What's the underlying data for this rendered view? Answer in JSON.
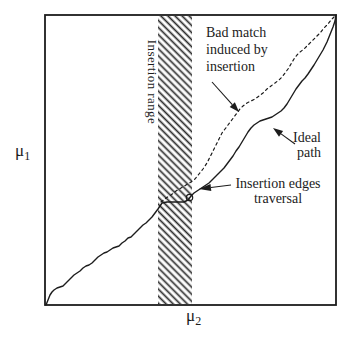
{
  "figure": {
    "background": "#ffffff",
    "ink": "#1c1c1c",
    "labels": {
      "mu1": {
        "base": "μ",
        "sub": "1"
      },
      "mu2": {
        "base": "μ",
        "sub": "2"
      },
      "insertion_range": "Insertion range",
      "bad_match_line1": "Bad match",
      "bad_match_line2": "induced by",
      "bad_match_line3": "insertion",
      "ideal_line1": "Ideal",
      "ideal_line2": "path",
      "insertion_edges_line1": "Insertion edges",
      "insertion_edges_line2": "traversal"
    }
  },
  "chart_data": {
    "type": "line",
    "title": "",
    "xlabel": "μ2",
    "ylabel": "μ1",
    "grid": false,
    "frame": {
      "x": 45,
      "y": 15,
      "w": 291,
      "h": 290
    },
    "insertion_band": {
      "x": 158,
      "w": 34
    },
    "loop": {
      "cx": 189.5,
      "cy": 197.5,
      "r": 3.2
    },
    "series": [
      {
        "name": "Ideal path",
        "style": "solid",
        "points": [
          [
            46,
            305
          ],
          [
            48,
            300
          ],
          [
            50,
            295
          ],
          [
            52,
            292
          ],
          [
            54,
            290
          ],
          [
            57,
            288
          ],
          [
            60,
            287
          ],
          [
            63,
            286
          ],
          [
            65,
            284
          ],
          [
            68,
            281
          ],
          [
            71,
            278
          ],
          [
            74,
            275
          ],
          [
            77,
            273
          ],
          [
            80,
            271
          ],
          [
            83,
            268
          ],
          [
            86,
            266
          ],
          [
            89,
            265
          ],
          [
            92,
            263
          ],
          [
            95,
            260
          ],
          [
            98,
            257
          ],
          [
            101,
            255
          ],
          [
            104,
            253
          ],
          [
            107,
            252
          ],
          [
            110,
            250
          ],
          [
            113,
            248
          ],
          [
            116,
            247
          ],
          [
            119,
            246
          ],
          [
            122,
            243
          ],
          [
            125,
            241
          ],
          [
            128,
            238
          ],
          [
            131,
            237
          ],
          [
            134,
            234
          ],
          [
            137,
            231
          ],
          [
            140,
            228
          ],
          [
            143,
            225
          ],
          [
            146,
            223
          ],
          [
            149,
            220
          ],
          [
            152,
            217
          ],
          [
            155,
            213
          ],
          [
            158,
            209
          ],
          [
            160,
            206
          ],
          [
            162,
            203
          ],
          [
            167,
            202
          ],
          [
            173,
            202
          ],
          [
            179,
            202
          ],
          [
            184,
            202
          ],
          [
            188,
            200
          ],
          [
            191,
            196
          ],
          [
            194,
            193
          ],
          [
            197,
            191
          ],
          [
            200,
            189
          ],
          [
            203,
            187
          ],
          [
            206,
            185
          ],
          [
            209,
            183
          ],
          [
            212,
            180
          ],
          [
            215,
            177
          ],
          [
            218,
            174
          ],
          [
            221,
            171
          ],
          [
            224,
            168
          ],
          [
            227,
            164
          ],
          [
            230,
            160
          ],
          [
            233,
            156
          ],
          [
            236,
            151
          ],
          [
            239,
            147
          ],
          [
            242,
            142
          ],
          [
            245,
            137
          ],
          [
            248,
            132
          ],
          [
            251,
            128
          ],
          [
            254,
            125
          ],
          [
            257,
            123
          ],
          [
            260,
            121
          ],
          [
            263,
            120
          ],
          [
            266,
            119
          ],
          [
            269,
            118
          ],
          [
            272,
            117
          ],
          [
            275,
            115
          ],
          [
            278,
            113
          ],
          [
            281,
            111
          ],
          [
            284,
            108
          ],
          [
            287,
            104
          ],
          [
            290,
            99
          ],
          [
            293,
            94
          ],
          [
            296,
            89
          ],
          [
            299,
            85
          ],
          [
            302,
            81
          ],
          [
            305,
            78
          ],
          [
            308,
            74
          ],
          [
            310,
            71
          ],
          [
            312,
            68
          ],
          [
            314,
            65
          ],
          [
            317,
            60
          ],
          [
            320,
            55
          ],
          [
            323,
            50
          ],
          [
            325,
            46
          ],
          [
            327,
            42
          ],
          [
            329,
            37
          ],
          [
            331,
            32
          ],
          [
            333,
            27
          ],
          [
            335,
            21
          ],
          [
            336,
            15
          ]
        ]
      },
      {
        "name": "Bad match induced by insertion",
        "style": "dashed",
        "points": [
          [
            161,
            202
          ],
          [
            166,
            198
          ],
          [
            171,
            195
          ],
          [
            176,
            191
          ],
          [
            181,
            188
          ],
          [
            186,
            185
          ],
          [
            191,
            182
          ],
          [
            195,
            179
          ],
          [
            199,
            174
          ],
          [
            203,
            169
          ],
          [
            207,
            163
          ],
          [
            210,
            157
          ],
          [
            213,
            151
          ],
          [
            216,
            145
          ],
          [
            219,
            139
          ],
          [
            222,
            133
          ],
          [
            225,
            129
          ],
          [
            228,
            125
          ],
          [
            231,
            121
          ],
          [
            234,
            117
          ],
          [
            237,
            113
          ],
          [
            240,
            109
          ],
          [
            243,
            106
          ],
          [
            247,
            103
          ],
          [
            251,
            101
          ],
          [
            255,
            99
          ],
          [
            259,
            96
          ],
          [
            263,
            93
          ],
          [
            267,
            89
          ],
          [
            271,
            86
          ],
          [
            275,
            83
          ],
          [
            279,
            80
          ],
          [
            282,
            77
          ],
          [
            285,
            73
          ],
          [
            288,
            69
          ],
          [
            291,
            64
          ],
          [
            294,
            59
          ],
          [
            297,
            55
          ],
          [
            300,
            52
          ],
          [
            304,
            49
          ],
          [
            308,
            45
          ],
          [
            312,
            41
          ],
          [
            316,
            37
          ],
          [
            320,
            33
          ],
          [
            324,
            28
          ],
          [
            328,
            24
          ],
          [
            331,
            20
          ],
          [
            334,
            17
          ],
          [
            336,
            15
          ]
        ]
      }
    ],
    "arrows": [
      {
        "name": "bad-match-arrow",
        "from": [
          212,
          82
        ],
        "to": [
          239,
          112
        ],
        "head_l": 10,
        "head_w": 7
      },
      {
        "name": "ideal-path-arrow",
        "from": [
          295,
          144
        ],
        "to": [
          273,
          128
        ],
        "head_l": 10,
        "head_w": 7
      },
      {
        "name": "insertion-edges-arrow",
        "from": [
          231,
          185
        ],
        "to": [
          199,
          189
        ],
        "head_l": 12,
        "head_w": 7
      }
    ]
  }
}
